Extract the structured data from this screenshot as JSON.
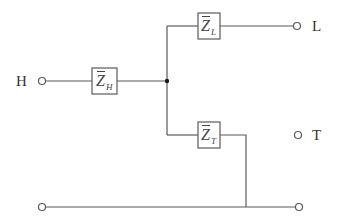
{
  "diagram": {
    "type": "three-winding transformer equivalent circuit",
    "terminals": {
      "high": {
        "label": "H"
      },
      "low": {
        "label": "L"
      },
      "tertiary": {
        "label": "T"
      }
    },
    "impedances": {
      "high": {
        "symbol": "Z",
        "subscript": "H",
        "overbar": true
      },
      "low": {
        "symbol": "Z",
        "subscript": "L",
        "overbar": true
      },
      "tertiary": {
        "symbol": "Z",
        "subscript": "T",
        "overbar": true
      }
    },
    "colors": {
      "wire": "#5a5a5a",
      "junction": "#1a1a1a",
      "text": "#333333",
      "background": "#ffffff"
    }
  }
}
